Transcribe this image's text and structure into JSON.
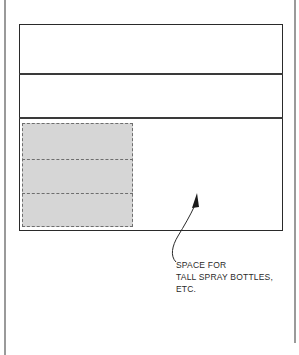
{
  "diagram": {
    "title": "",
    "annotation": {
      "lines": [
        "SPACE FOR",
        "TALL SPRAY BOTTLES,",
        "ETC."
      ]
    },
    "shelves": [
      {
        "name": "upper-shelf"
      },
      {
        "name": "middle-shelf"
      },
      {
        "name": "lower-compartment"
      }
    ],
    "stacked_items": 3,
    "colors": {
      "outline": "#2a2a2a",
      "frame": "#9a9a9a",
      "shaded": "#d6d6d6",
      "dash": "#6e6e6e"
    }
  }
}
